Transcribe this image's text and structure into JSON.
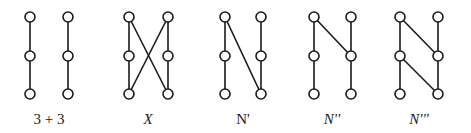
{
  "diagram": {
    "title": "",
    "node_radius": 5,
    "stroke_color": "#1a1a1a",
    "background": "#ffffff",
    "figures": [
      {
        "id": "3+3",
        "label": "3 + 3",
        "italic": false,
        "label_x": 49,
        "nodes": [
          {
            "id": "a1",
            "x": 30,
            "y": 17
          },
          {
            "id": "a2",
            "x": 30,
            "y": 56
          },
          {
            "id": "a3",
            "x": 30,
            "y": 94
          },
          {
            "id": "b1",
            "x": 68,
            "y": 17
          },
          {
            "id": "b2",
            "x": 68,
            "y": 56
          },
          {
            "id": "b3",
            "x": 68,
            "y": 94
          }
        ],
        "edges": [
          [
            "a1",
            "a2"
          ],
          [
            "a2",
            "a3"
          ],
          [
            "b1",
            "b2"
          ],
          [
            "b2",
            "b3"
          ]
        ]
      },
      {
        "id": "X",
        "label": "X",
        "italic": true,
        "label_x": 148,
        "nodes": [
          {
            "id": "a1",
            "x": 129,
            "y": 17
          },
          {
            "id": "a2",
            "x": 129,
            "y": 56
          },
          {
            "id": "a3",
            "x": 129,
            "y": 94
          },
          {
            "id": "b1",
            "x": 168,
            "y": 17
          },
          {
            "id": "b2",
            "x": 168,
            "y": 56
          },
          {
            "id": "b3",
            "x": 168,
            "y": 94
          }
        ],
        "edges": [
          [
            "a1",
            "a2"
          ],
          [
            "a2",
            "a3"
          ],
          [
            "b1",
            "b2"
          ],
          [
            "b2",
            "b3"
          ],
          [
            "a1",
            "b3"
          ],
          [
            "b1",
            "a3"
          ]
        ]
      },
      {
        "id": "N'",
        "label": "N'",
        "italic": false,
        "label_x": 243,
        "nodes": [
          {
            "id": "a1",
            "x": 225,
            "y": 17
          },
          {
            "id": "a2",
            "x": 225,
            "y": 56
          },
          {
            "id": "a3",
            "x": 225,
            "y": 94
          },
          {
            "id": "b1",
            "x": 261,
            "y": 17
          },
          {
            "id": "b2",
            "x": 261,
            "y": 56
          },
          {
            "id": "b3",
            "x": 261,
            "y": 94
          }
        ],
        "edges": [
          [
            "a1",
            "a2"
          ],
          [
            "a2",
            "a3"
          ],
          [
            "b1",
            "b2"
          ],
          [
            "b2",
            "b3"
          ],
          [
            "a1",
            "b3"
          ]
        ]
      },
      {
        "id": "N''",
        "label": "N''",
        "italic": true,
        "label_x": 332,
        "nodes": [
          {
            "id": "a1",
            "x": 314,
            "y": 17
          },
          {
            "id": "a2",
            "x": 314,
            "y": 56
          },
          {
            "id": "a3",
            "x": 314,
            "y": 94
          },
          {
            "id": "b1",
            "x": 351,
            "y": 17
          },
          {
            "id": "b2",
            "x": 351,
            "y": 56
          },
          {
            "id": "b3",
            "x": 351,
            "y": 94
          }
        ],
        "edges": [
          [
            "a1",
            "a2"
          ],
          [
            "a2",
            "a3"
          ],
          [
            "b1",
            "b2"
          ],
          [
            "b2",
            "b3"
          ],
          [
            "a1",
            "b2"
          ]
        ]
      },
      {
        "id": "N'''",
        "label": "N'''",
        "italic": true,
        "label_x": 419,
        "nodes": [
          {
            "id": "a1",
            "x": 400,
            "y": 17
          },
          {
            "id": "a2",
            "x": 400,
            "y": 56
          },
          {
            "id": "a3",
            "x": 400,
            "y": 94
          },
          {
            "id": "b1",
            "x": 438,
            "y": 17
          },
          {
            "id": "b2",
            "x": 438,
            "y": 56
          },
          {
            "id": "b3",
            "x": 438,
            "y": 94
          }
        ],
        "edges": [
          [
            "a1",
            "a2"
          ],
          [
            "a2",
            "a3"
          ],
          [
            "b1",
            "b2"
          ],
          [
            "b2",
            "b3"
          ],
          [
            "a1",
            "b2"
          ],
          [
            "a2",
            "b3"
          ]
        ]
      }
    ]
  }
}
